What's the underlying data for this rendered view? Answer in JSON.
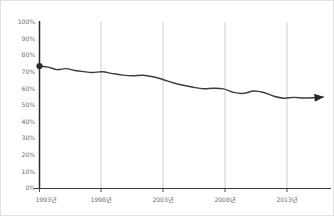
{
  "chart_data": {
    "type": "line",
    "title": "",
    "subtitle": "",
    "xlabel": "",
    "ylabel": "",
    "grid": "vertical-only",
    "legend": "none",
    "xlim": [
      1993,
      2015.5
    ],
    "ylim": [
      0,
      100
    ],
    "y_ticks": [
      "0%",
      "10%",
      "20%",
      "30%",
      "40%",
      "50%",
      "60%",
      "70%",
      "80%",
      "90%",
      "100%"
    ],
    "y_tick_values": [
      0,
      10,
      20,
      30,
      40,
      50,
      60,
      70,
      80,
      90,
      100
    ],
    "x_ticks": [
      "1993년",
      "1998년",
      "2003년",
      "2008년",
      "2013년"
    ],
    "x_tick_values": [
      1993,
      1998,
      2003,
      2008,
      2013
    ],
    "series": [
      {
        "name": "",
        "color": "#3d3d3d",
        "start_marker": "filled-circle",
        "end_marker": "arrowhead",
        "x": [
          1993,
          1993.7,
          1994.4,
          1995.1,
          1995.8,
          1996.5,
          1997.2,
          1998,
          1998.8,
          1999.6,
          2000.4,
          2001.2,
          2002,
          2002.8,
          2003.6,
          2004.4,
          2005.2,
          2006,
          2006.8,
          2007.6,
          2008.4,
          2009.2,
          2010,
          2010.8,
          2011.6,
          2012.4,
          2013.2,
          2014,
          2014.8,
          2015.5
        ],
        "values": [
          73.5,
          72.8,
          71.3,
          71.9,
          70.8,
          70.1,
          69.6,
          70.0,
          68.9,
          68.0,
          67.6,
          67.9,
          67.0,
          65.4,
          63.4,
          61.9,
          60.7,
          59.8,
          60.1,
          59.7,
          57.6,
          57.0,
          58.4,
          57.5,
          55.3,
          54.1,
          54.6,
          54.2,
          54.4,
          54.8
        ]
      }
    ]
  }
}
